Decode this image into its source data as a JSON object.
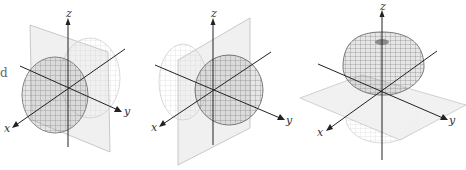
{
  "figure": {
    "edge_fragment": "d",
    "panels": [
      {
        "id": "panel-1",
        "description": "Lobe along positive x axis with faint lobe behind, yz-plane",
        "plane": "yz",
        "axes": {
          "x": "x",
          "y": "y",
          "z": "z"
        }
      },
      {
        "id": "panel-2",
        "description": "Lobe along positive y axis with faint lobe on negative y side, xz-plane",
        "plane": "xz",
        "axes": {
          "x": "x",
          "y": "y",
          "z": "z"
        }
      },
      {
        "id": "panel-3",
        "description": "Lobe along positive z axis with faint lobe below, xy-plane",
        "plane": "xy",
        "axes": {
          "x": "x",
          "y": "y",
          "z": "z"
        }
      }
    ]
  },
  "colors": {
    "axis": "#2a2a2a",
    "lobe_front": "#7a7a7a",
    "lobe_back": "#c8c8c8",
    "plane_fill": "#eeeeee",
    "plane_edge": "#bbbbbb"
  }
}
